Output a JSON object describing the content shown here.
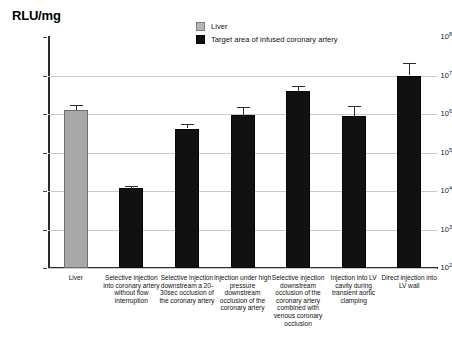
{
  "chart_data": {
    "type": "bar",
    "title": "",
    "ylabel": "RLU/mg",
    "xlabel": "",
    "yscale": "log",
    "ylim": [
      100,
      100000000
    ],
    "grid": true,
    "legend_position": "top-center",
    "ytick_labels": [
      "10^8",
      "10^7",
      "10^6",
      "10^5",
      "10^4",
      "10^3",
      "10^2"
    ],
    "ytick_values": [
      100000000,
      10000000,
      1000000,
      100000,
      10000,
      1000,
      100
    ],
    "categories": [
      "Liver",
      "Selective injection into coronary artery without flow interruption",
      "Selective injection downstream a 20-30sec occlusion of the coronary artery",
      "Injection under high pressure downstream occlusion of the coronary artery",
      "Selective injection downstream occlusion of the coronary artery combined with venous coronary occlusion",
      "Injection into LV cavity during transient aortic clamping",
      "Direct injection into LV wall"
    ],
    "values": [
      1300000,
      12000,
      420000,
      950000,
      4000000,
      900000,
      10000000
    ],
    "err_low": [
      1100000,
      10500,
      330000,
      720000,
      3100000,
      600000,
      6500000
    ],
    "err_high": [
      1750000,
      13500,
      560000,
      1500000,
      5400000,
      1600000,
      21000000
    ],
    "series_group": [
      "Liver",
      "Target",
      "Target",
      "Target",
      "Target",
      "Target",
      "Target"
    ],
    "colors": {
      "liver": "#a8a8a8",
      "target": "#111111",
      "gridline": "#c9c9c9",
      "axis": "#2b2b2b"
    },
    "legend": [
      {
        "label": "Liver",
        "swatch": "gray"
      },
      {
        "label": "Target area of infused coronary artery",
        "swatch": "dark"
      }
    ]
  },
  "labels": {
    "ytick_0": "10",
    "ytick_0_exp": "8",
    "ytick_1": "10",
    "ytick_1_exp": "7",
    "ytick_2": "10",
    "ytick_2_exp": "6",
    "ytick_3": "10",
    "ytick_3_exp": "5",
    "ytick_4": "10",
    "ytick_4_exp": "4",
    "ytick_5": "10",
    "ytick_5_exp": "3",
    "ytick_6": "10",
    "ytick_6_exp": "2"
  }
}
